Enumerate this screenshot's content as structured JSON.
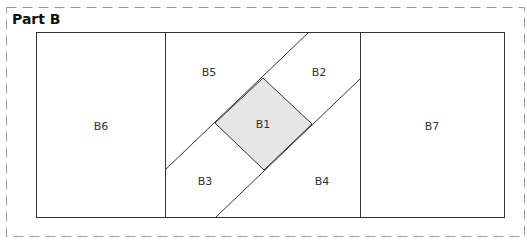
{
  "diagram": {
    "title": "Part B",
    "colors": {
      "line": "#333333",
      "dashed_border": "#9a9a9a",
      "highlight_fill": "#e6e6e6",
      "label": "#333333"
    },
    "regions": [
      {
        "id": "B1",
        "label": "B1",
        "shape": "square-rotated-45",
        "highlighted": true
      },
      {
        "id": "B2",
        "label": "B2"
      },
      {
        "id": "B3",
        "label": "B3"
      },
      {
        "id": "B4",
        "label": "B4"
      },
      {
        "id": "B5",
        "label": "B5"
      },
      {
        "id": "B6",
        "label": "B6"
      },
      {
        "id": "B7",
        "label": "B7"
      }
    ]
  }
}
